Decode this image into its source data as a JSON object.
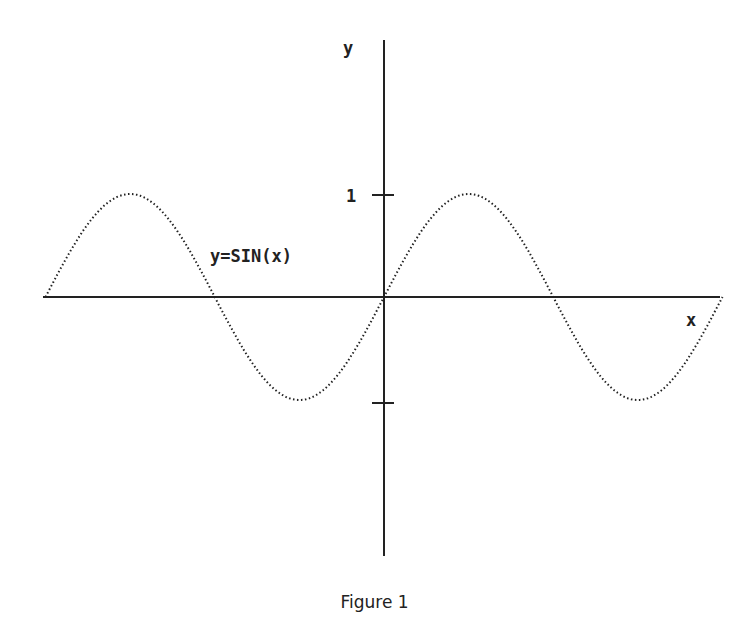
{
  "chart_data": {
    "type": "line",
    "title": "",
    "caption": "Figure 1",
    "curve_label": "y=SIN(x)",
    "xlabel": "x",
    "ylabel": "y",
    "y_ticks": [
      {
        "value": 1,
        "label": "1"
      },
      {
        "value": -1,
        "label": ""
      }
    ],
    "xlim": [
      -6.283,
      6.283
    ],
    "ylim": [
      -2.5,
      2.5
    ],
    "grid": false,
    "legend": "none",
    "series": [
      {
        "name": "y=SIN(x)",
        "style": "dotted",
        "x": [
          -6.283,
          -5.498,
          -4.712,
          -3.927,
          -3.142,
          -2.356,
          -1.571,
          -0.785,
          0,
          0.785,
          1.571,
          2.356,
          3.142,
          3.927,
          4.712,
          5.498,
          6.283
        ],
        "values": [
          0,
          0.707,
          1,
          0.707,
          0,
          -0.707,
          -1,
          -0.707,
          0,
          0.707,
          1,
          0.707,
          0,
          -0.707,
          -1,
          -0.707,
          0
        ]
      }
    ]
  },
  "colors": {
    "ink": "#222222",
    "background": "#ffffff"
  }
}
